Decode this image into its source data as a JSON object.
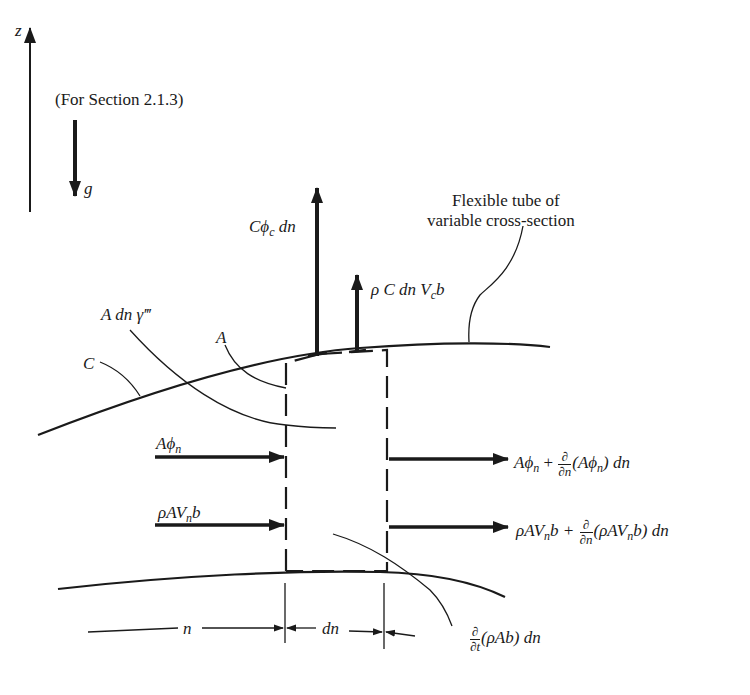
{
  "diagram": {
    "type": "control-volume schematic",
    "section_note": "(For Section 2.1.3)",
    "axis_label_z": "z",
    "gravity_label": "g",
    "tube_label_line1": "Flexible tube of",
    "tube_label_line2": "variable cross-section",
    "labels": {
      "C_phi_c": "Cϕ",
      "C_phi_c_sub": "c",
      "C_phi_c_tail": " dn",
      "rho_C": "ρ C dn V",
      "rho_C_sub": "c",
      "rho_C_tail": "b",
      "gamma": "A dn γ‴",
      "A": "A",
      "C": "C",
      "A_phi_n": "Aϕ",
      "A_phi_n_sub": "n",
      "rho_AVnb": "ρAV",
      "rho_AVnb_sub": "n",
      "rho_AVnb_tail": "b",
      "out_phi_1": "Aϕ",
      "out_phi_sub": "n",
      "out_phi_plus": " + ",
      "partial": "∂",
      "dn_den": "∂n",
      "dt_den": "∂t",
      "out_phi_paren": "(Aϕ",
      "out_phi_paren_close": ") dn",
      "out_rho_1": "ρAV",
      "out_rho_sub": "n",
      "out_rho_b": "b + ",
      "out_rho_paren": "(ρAV",
      "out_rho_paren_close": "b) dn",
      "storage": "(ρAb) dn",
      "dim_n": "n",
      "dim_dn": "dn"
    },
    "colors": {
      "ink": "#1a1a1a",
      "background": "#ffffff"
    }
  }
}
